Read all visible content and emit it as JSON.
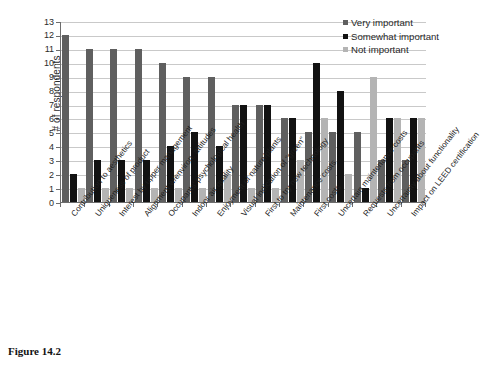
{
  "figure": {
    "caption": "Figure 14.2"
  },
  "legend": {
    "position": "top-right",
    "items": [
      {
        "label": "Very important",
        "color": "#5f5f5f",
        "icon": "square-swatch-icon"
      },
      {
        "label": "Somewhat important",
        "color": "#121212",
        "icon": "square-swatch-icon"
      },
      {
        "label": "Not important",
        "color": "#b4b4b4",
        "icon": "square-swatch-icon"
      }
    ]
  },
  "chart_data": {
    "type": "bar",
    "title": "",
    "subtitle": "",
    "xlabel": "",
    "ylabel": "# of respondents",
    "ylim": [
      0,
      13
    ],
    "ytick_labels": [
      "0",
      "1",
      "2",
      "3",
      "4",
      "5",
      "6",
      "7",
      "8",
      "9",
      "10",
      "11",
      "12",
      "13"
    ],
    "grid": true,
    "grouping": "grouped",
    "categories": [
      "Contribution to aesthetics",
      "Uniqueness of product",
      "Interest by upper management",
      "Alignment w/environ. attitudes",
      "Occupants' psychological health",
      "Indoor air quality",
      "Enjoyment of nature/plants",
      "Visual indication of \"green\"",
      "First to try new technology",
      "Maintenance costs",
      "First costs",
      "Uncertain maintenance costs",
      "Requests from occupants",
      "Uncertainty about functionality",
      "Impact on LEED certification"
    ],
    "series": [
      {
        "name": "Very important",
        "color": "#5f5f5f",
        "values": [
          12,
          11,
          11,
          11,
          10,
          9,
          9,
          7,
          7,
          6,
          5,
          5,
          5,
          3,
          3
        ]
      },
      {
        "name": "Somewhat important",
        "color": "#121212",
        "values": [
          2,
          3,
          3,
          3,
          4,
          5,
          4,
          7,
          7,
          6,
          10,
          8,
          1,
          6,
          6
        ]
      },
      {
        "name": "Not important",
        "color": "#b4b4b4",
        "values": [
          1,
          1,
          1,
          1,
          1,
          1,
          2,
          1,
          1,
          3,
          6,
          2,
          9,
          6,
          6
        ]
      }
    ]
  }
}
